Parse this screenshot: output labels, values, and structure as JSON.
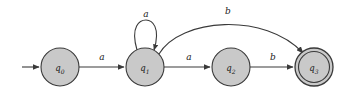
{
  "figure": {
    "name": "dfa-state-diagram",
    "width": 351,
    "height": 98,
    "background_color": "#ffffff",
    "stroke_color": "#3a3a3a",
    "state_fill_color": "#c9c9c9",
    "label_color": "#1a1a1a"
  },
  "states": [
    {
      "id": "q0",
      "name": "q",
      "subscript": "0",
      "cx": 60,
      "cy": 67,
      "r": 19,
      "accepting": false,
      "initial": true
    },
    {
      "id": "q1",
      "name": "q",
      "subscript": "1",
      "cx": 145,
      "cy": 67,
      "r": 19,
      "accepting": false,
      "initial": false
    },
    {
      "id": "q2",
      "name": "q",
      "subscript": "2",
      "cx": 231,
      "cy": 67,
      "r": 19,
      "accepting": false,
      "initial": false
    },
    {
      "id": "q3",
      "name": "q",
      "subscript": "3",
      "cx": 314,
      "cy": 67,
      "r": 19,
      "accepting": true,
      "initial": false
    }
  ],
  "start_arrow": {
    "label": "start-arrow",
    "x1": 22,
    "y1": 67,
    "x2": 40,
    "y2": 67
  },
  "transitions": [
    {
      "id": "t0",
      "from": "q0",
      "to": "q1",
      "symbol": "a",
      "shape": "straight",
      "label_x": 102,
      "label_y": 57
    },
    {
      "id": "t1",
      "from": "q1",
      "to": "q1",
      "symbol": "a",
      "shape": "self-loop",
      "label_x": 146,
      "label_y": 14
    },
    {
      "id": "t2",
      "from": "q1",
      "to": "q2",
      "symbol": "a",
      "shape": "straight",
      "label_x": 189,
      "label_y": 57
    },
    {
      "id": "t3",
      "from": "q1",
      "to": "q3",
      "symbol": "b",
      "shape": "arc",
      "label_x": 228,
      "label_y": 11
    },
    {
      "id": "t4",
      "from": "q2",
      "to": "q3",
      "symbol": "b",
      "shape": "straight",
      "label_x": 273,
      "label_y": 57
    }
  ]
}
